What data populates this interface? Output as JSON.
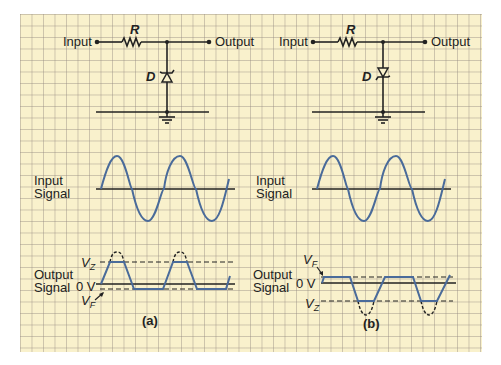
{
  "panels": [
    {
      "id": "a",
      "caption": "(a)",
      "circuit": {
        "input_label": "Input",
        "output_label": "Output",
        "resistor_label": "R",
        "diode_label": "D",
        "diode_orientation": "cathode-up (zener reverse-biased for positive input)"
      },
      "input_signal_label_line1": "Input",
      "input_signal_label_line2": "Signal",
      "output_signal_label_line1": "Output",
      "output_signal_label_line2": "Signal",
      "zero_label": "0 V",
      "upper_level_label": "V",
      "upper_level_sub": "Z",
      "lower_level_label": "V",
      "lower_level_sub": "F"
    },
    {
      "id": "b",
      "caption": "(b)",
      "circuit": {
        "input_label": "Input",
        "output_label": "Output",
        "resistor_label": "R",
        "diode_label": "D",
        "diode_orientation": "cathode-down (zener reverse-biased for negative input)"
      },
      "input_signal_label_line1": "Input",
      "input_signal_label_line2": "Signal",
      "output_signal_label_line1": "Output",
      "output_signal_label_line2": "Signal",
      "zero_label": "0 V",
      "upper_level_label": "V",
      "upper_level_sub": "F",
      "lower_level_label": "V",
      "lower_level_sub": "Z"
    }
  ],
  "colors": {
    "paper": "#f9f1cc",
    "grid": "#a09a90",
    "waveform": "#4a6b9a",
    "ink": "#222222"
  }
}
